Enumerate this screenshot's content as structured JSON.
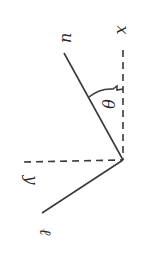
{
  "diagram": {
    "type": "geometry-sketch",
    "style": "hand-drawn",
    "orientation": "rotated 90 degrees",
    "stroke_color": "#3a3a3a",
    "background": "#ffffff",
    "origin": {
      "x": 123,
      "y": 160
    },
    "labels": {
      "x_axis": "x",
      "y_axis": "y",
      "line_u": "u",
      "angle": "θ",
      "line_l": "ℓ"
    },
    "elements": [
      {
        "kind": "dashed-line",
        "name": "x-axis",
        "label": "x"
      },
      {
        "kind": "dashed-line",
        "name": "y-axis",
        "label": "y"
      },
      {
        "kind": "solid-line",
        "name": "u-line",
        "label": "u"
      },
      {
        "kind": "solid-line",
        "name": "l-line",
        "label": "ℓ"
      },
      {
        "kind": "arc",
        "name": "theta-arc",
        "label": "θ",
        "between": [
          "x-axis",
          "u-line"
        ]
      }
    ]
  }
}
